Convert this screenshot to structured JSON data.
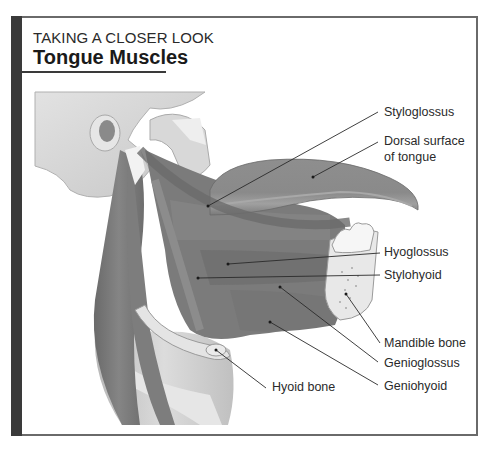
{
  "header": {
    "kicker": "TAKING A CLOSER LOOK",
    "title": "Tongue Muscles"
  },
  "figure": {
    "labels": [
      {
        "id": "styloglossus",
        "text": "Styloglossus",
        "x": 384,
        "y": 106,
        "line": [
          208,
          206,
          378,
          112
        ]
      },
      {
        "id": "dorsal-surface",
        "text": "Dorsal surface",
        "x": 384,
        "y": 135,
        "line": [
          313,
          177,
          378,
          142
        ]
      },
      {
        "id": "dorsal-surface-2",
        "text": "of tongue",
        "x": 384,
        "y": 150
      },
      {
        "id": "hyoglossus",
        "text": "Hyoglossus",
        "x": 384,
        "y": 245,
        "line": [
          228,
          264,
          380,
          253
        ]
      },
      {
        "id": "stylohyoid",
        "text": "Stylohyoid",
        "x": 384,
        "y": 268,
        "line": [
          198,
          278,
          380,
          275
        ]
      },
      {
        "id": "mandible-bone",
        "text": "Mandible bone",
        "x": 384,
        "y": 336,
        "line": [
          346,
          294,
          380,
          343
        ]
      },
      {
        "id": "genioglossus",
        "text": "Genioglossus",
        "x": 384,
        "y": 356,
        "line": [
          280,
          287,
          378,
          362
        ]
      },
      {
        "id": "geniohyoid",
        "text": "Geniohyoid",
        "x": 384,
        "y": 379,
        "line": [
          270,
          322,
          378,
          385
        ]
      },
      {
        "id": "hyoid-bone",
        "text": "Hyoid bone",
        "x": 272,
        "y": 380,
        "line": [
          216,
          350,
          266,
          388
        ]
      }
    ]
  },
  "colors": {
    "frame": "#6a6a6a",
    "side_bar": "#3a3a3a",
    "bone": "#d4d4d4",
    "muscle": "#7a7a7a",
    "tongue": "#8c8c8c"
  }
}
